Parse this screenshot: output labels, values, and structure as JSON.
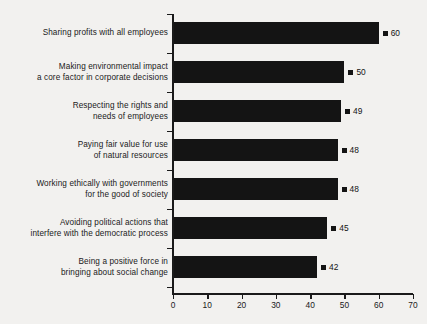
{
  "chart_data": {
    "type": "bar",
    "orientation": "horizontal",
    "title": "",
    "xlabel": "",
    "ylabel": "",
    "xlim": [
      0,
      70
    ],
    "xticks": [
      0,
      10,
      20,
      30,
      40,
      50,
      60,
      70
    ],
    "grid": false,
    "legend": false,
    "bar_color": "#141414",
    "background_color": "#f2f1ef",
    "categories": [
      "Sharing profits with all employees",
      "Making environmental impact a core factor in corporate decisions",
      "Respecting the rights and needs of employees",
      "Paying fair value for use of natural resources",
      "Working ethically with governments for the good of society",
      "Avoiding political actions that interfere with the democratic process",
      "Being a positive force in bringing about social change"
    ],
    "category_lines": [
      [
        "Sharing profits with all employees"
      ],
      [
        "Making environmental impact",
        "a core factor in corporate decisions"
      ],
      [
        "Respecting the rights and",
        "needs of employees"
      ],
      [
        "Paying fair value for use",
        "of natural resources"
      ],
      [
        "Working ethically with governments",
        "for the good of society"
      ],
      [
        "Avoiding political actions that",
        "interfere with the democratic process"
      ],
      [
        "Being a positive force in",
        "bringing about social change"
      ]
    ],
    "values": [
      60,
      50,
      49,
      48,
      48,
      45,
      42
    ],
    "value_labels": [
      "60",
      "50",
      "49",
      "48",
      "48",
      "45",
      "42"
    ]
  },
  "footnote": ""
}
